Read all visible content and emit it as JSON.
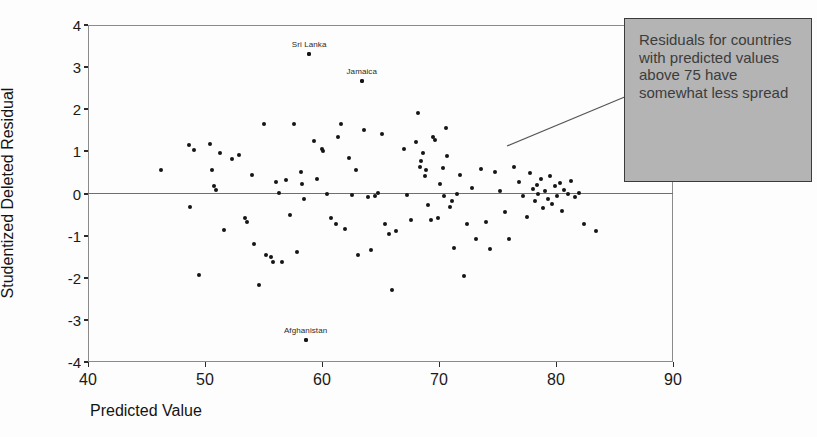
{
  "chart_data": {
    "type": "scatter",
    "title": "",
    "xlabel": "Predicted Value",
    "ylabel": "Studentized Deleted Residual",
    "xlim": [
      40,
      90
    ],
    "ylim": [
      -4,
      4
    ],
    "xticks": [
      40,
      50,
      60,
      70,
      80,
      90
    ],
    "yticks": [
      4,
      3,
      2,
      1,
      0,
      -1,
      -2,
      -3,
      -4
    ],
    "grid": false,
    "reference_line_y": 0,
    "legend": "none",
    "points": [
      {
        "x": 46.2,
        "y": 0.55
      },
      {
        "x": 48.6,
        "y": 1.15
      },
      {
        "x": 48.7,
        "y": -0.33
      },
      {
        "x": 49.1,
        "y": 1.04
      },
      {
        "x": 49.5,
        "y": -1.93
      },
      {
        "x": 50.4,
        "y": 1.17
      },
      {
        "x": 50.6,
        "y": 0.55
      },
      {
        "x": 50.8,
        "y": 0.18
      },
      {
        "x": 50.9,
        "y": 0.08
      },
      {
        "x": 51.3,
        "y": 0.97
      },
      {
        "x": 51.6,
        "y": -0.87
      },
      {
        "x": 52.3,
        "y": 0.82
      },
      {
        "x": 52.9,
        "y": 0.92
      },
      {
        "x": 53.4,
        "y": -0.58
      },
      {
        "x": 53.6,
        "y": -0.67
      },
      {
        "x": 54.0,
        "y": 0.44
      },
      {
        "x": 54.2,
        "y": -1.2
      },
      {
        "x": 54.6,
        "y": -2.17
      },
      {
        "x": 55.0,
        "y": 1.66
      },
      {
        "x": 55.2,
        "y": -1.47
      },
      {
        "x": 55.6,
        "y": -1.5
      },
      {
        "x": 55.8,
        "y": -1.63
      },
      {
        "x": 56.1,
        "y": 0.27
      },
      {
        "x": 56.3,
        "y": 0.02
      },
      {
        "x": 56.6,
        "y": -1.62
      },
      {
        "x": 56.9,
        "y": 0.31
      },
      {
        "x": 57.3,
        "y": -0.52
      },
      {
        "x": 57.6,
        "y": 1.66
      },
      {
        "x": 57.9,
        "y": -1.38
      },
      {
        "x": 58.2,
        "y": 0.5
      },
      {
        "x": 58.3,
        "y": 0.23
      },
      {
        "x": 58.5,
        "y": -0.13
      },
      {
        "x": 58.6,
        "y": -3.48
      },
      {
        "x": 58.9,
        "y": 3.3
      },
      {
        "x": 59.3,
        "y": 1.25
      },
      {
        "x": 59.6,
        "y": 0.35
      },
      {
        "x": 60.0,
        "y": 1.05
      },
      {
        "x": 60.1,
        "y": 1.0
      },
      {
        "x": 60.4,
        "y": -0.02
      },
      {
        "x": 60.8,
        "y": -0.58
      },
      {
        "x": 61.2,
        "y": -0.72
      },
      {
        "x": 61.4,
        "y": 1.35
      },
      {
        "x": 61.6,
        "y": 1.64
      },
      {
        "x": 62.0,
        "y": -0.85
      },
      {
        "x": 62.3,
        "y": 0.84
      },
      {
        "x": 62.6,
        "y": -0.03
      },
      {
        "x": 62.9,
        "y": 0.55
      },
      {
        "x": 63.1,
        "y": -1.45
      },
      {
        "x": 63.4,
        "y": 2.67
      },
      {
        "x": 63.6,
        "y": 1.5
      },
      {
        "x": 63.9,
        "y": -0.08
      },
      {
        "x": 64.2,
        "y": -1.35
      },
      {
        "x": 64.5,
        "y": -0.05
      },
      {
        "x": 64.8,
        "y": 0.01
      },
      {
        "x": 65.1,
        "y": 1.42
      },
      {
        "x": 65.4,
        "y": -0.72
      },
      {
        "x": 65.7,
        "y": -0.95
      },
      {
        "x": 66.0,
        "y": -2.28
      },
      {
        "x": 66.3,
        "y": -0.88
      },
      {
        "x": 67.0,
        "y": 1.05
      },
      {
        "x": 67.3,
        "y": -0.03
      },
      {
        "x": 67.6,
        "y": -0.63
      },
      {
        "x": 68.0,
        "y": 1.22
      },
      {
        "x": 68.2,
        "y": 1.9
      },
      {
        "x": 68.4,
        "y": 0.62
      },
      {
        "x": 68.5,
        "y": 0.78
      },
      {
        "x": 68.6,
        "y": 0.95
      },
      {
        "x": 68.8,
        "y": 0.42
      },
      {
        "x": 68.9,
        "y": 0.55
      },
      {
        "x": 69.1,
        "y": -0.28
      },
      {
        "x": 69.3,
        "y": -0.62
      },
      {
        "x": 69.5,
        "y": 1.35
      },
      {
        "x": 69.7,
        "y": 1.28
      },
      {
        "x": 69.9,
        "y": -0.58
      },
      {
        "x": 70.1,
        "y": 0.22
      },
      {
        "x": 70.3,
        "y": 0.6
      },
      {
        "x": 70.4,
        "y": -0.05
      },
      {
        "x": 70.6,
        "y": 1.55
      },
      {
        "x": 70.7,
        "y": 0.88
      },
      {
        "x": 70.9,
        "y": -0.32
      },
      {
        "x": 71.1,
        "y": -0.18
      },
      {
        "x": 71.3,
        "y": -1.3
      },
      {
        "x": 71.5,
        "y": -0.02
      },
      {
        "x": 71.8,
        "y": 0.45
      },
      {
        "x": 72.1,
        "y": -1.95
      },
      {
        "x": 72.4,
        "y": -0.72
      },
      {
        "x": 72.8,
        "y": 0.12
      },
      {
        "x": 73.2,
        "y": -1.07
      },
      {
        "x": 73.6,
        "y": 0.58
      },
      {
        "x": 74.0,
        "y": -0.68
      },
      {
        "x": 74.4,
        "y": -1.32
      },
      {
        "x": 74.8,
        "y": 0.5
      },
      {
        "x": 75.2,
        "y": 0.05
      },
      {
        "x": 75.6,
        "y": -0.45
      },
      {
        "x": 76.0,
        "y": -1.08
      },
      {
        "x": 76.4,
        "y": 0.62
      },
      {
        "x": 76.8,
        "y": 0.28
      },
      {
        "x": 77.2,
        "y": -0.05
      },
      {
        "x": 77.5,
        "y": -0.55
      },
      {
        "x": 77.8,
        "y": 0.48
      },
      {
        "x": 78.0,
        "y": 0.1
      },
      {
        "x": 78.2,
        "y": -0.18
      },
      {
        "x": 78.4,
        "y": 0.2
      },
      {
        "x": 78.5,
        "y": -0.02
      },
      {
        "x": 78.7,
        "y": 0.35
      },
      {
        "x": 78.9,
        "y": -0.35
      },
      {
        "x": 79.1,
        "y": 0.05
      },
      {
        "x": 79.3,
        "y": -0.12
      },
      {
        "x": 79.5,
        "y": 0.42
      },
      {
        "x": 79.7,
        "y": -0.25
      },
      {
        "x": 79.9,
        "y": 0.18
      },
      {
        "x": 80.1,
        "y": -0.05
      },
      {
        "x": 80.3,
        "y": 0.25
      },
      {
        "x": 80.5,
        "y": -0.42
      },
      {
        "x": 80.7,
        "y": 0.08
      },
      {
        "x": 81.0,
        "y": -0.02
      },
      {
        "x": 81.3,
        "y": 0.3
      },
      {
        "x": 81.6,
        "y": -0.08
      },
      {
        "x": 82.0,
        "y": 0.02
      },
      {
        "x": 82.4,
        "y": -0.72
      },
      {
        "x": 83.4,
        "y": -0.88
      }
    ],
    "labeled_points": [
      {
        "label": "Sri Lanka",
        "x": 58.9,
        "y": 3.3
      },
      {
        "label": "Jamaica",
        "x": 63.4,
        "y": 2.67
      },
      {
        "label": "Afghanistan",
        "x": 58.6,
        "y": -3.48
      }
    ],
    "annotation": {
      "text": "Residuals for countries with predicted values above 75 have somewhat less spread",
      "box_fill": "#b4b4b4",
      "box_border": "#3b3b3b",
      "text_color": "#3c3c3c"
    },
    "colors": {
      "point": "#151515",
      "frame": "#8b8b8b",
      "zero_line": "#6f6f6f",
      "background": "#ffffff"
    }
  }
}
